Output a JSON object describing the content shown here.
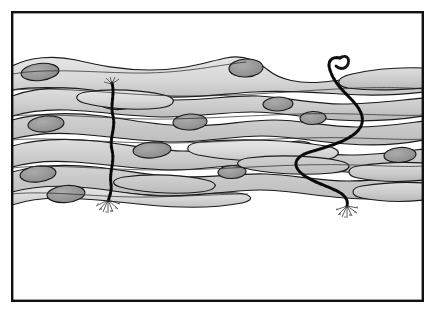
{
  "figure": {
    "caption": "",
    "background_color": "#ffffff",
    "frame": {
      "name": "figure-border",
      "x": 11,
      "y": 11,
      "width": 413,
      "height": 291,
      "stroke_color": "#111111",
      "stroke_width": 2.4,
      "fill": "none"
    },
    "palette": {
      "cell_fill_light": "#dcdcdc",
      "cell_fill_mid": "#c6c6c6",
      "cell_fill_dark": "#b4b4b4",
      "nucleus_fill": "#9a9a9a",
      "nucleus_fill_dark": "#8c8c8c",
      "outline": "#1a1a1a",
      "filament": "#141414",
      "blank_area": "#ffffff"
    },
    "tissue": {
      "name": "cell-layer-band",
      "description": "Dense horizontal bands of overlapping elongated spindle-shaped cells spanning the full frame width in the upper half",
      "top": 52,
      "bottom": 205,
      "band_count": 6
    },
    "filaments": [
      {
        "name": "filament-left-straight",
        "label": "vertical beaded filament",
        "orientation": "vertical",
        "start_x": 113,
        "start_y": 82,
        "end_x": 108,
        "end_y": 205,
        "tip_style": "splayed-root",
        "texture": "beaded"
      },
      {
        "name": "filament-right-sinuous",
        "label": "winding beaded filament",
        "orientation": "sinuous",
        "start_x": 336,
        "start_y": 56,
        "end_x": 346,
        "end_y": 208,
        "tip_style": "splayed-root",
        "head_style": "hooked-curl",
        "texture": "beaded"
      }
    ]
  }
}
